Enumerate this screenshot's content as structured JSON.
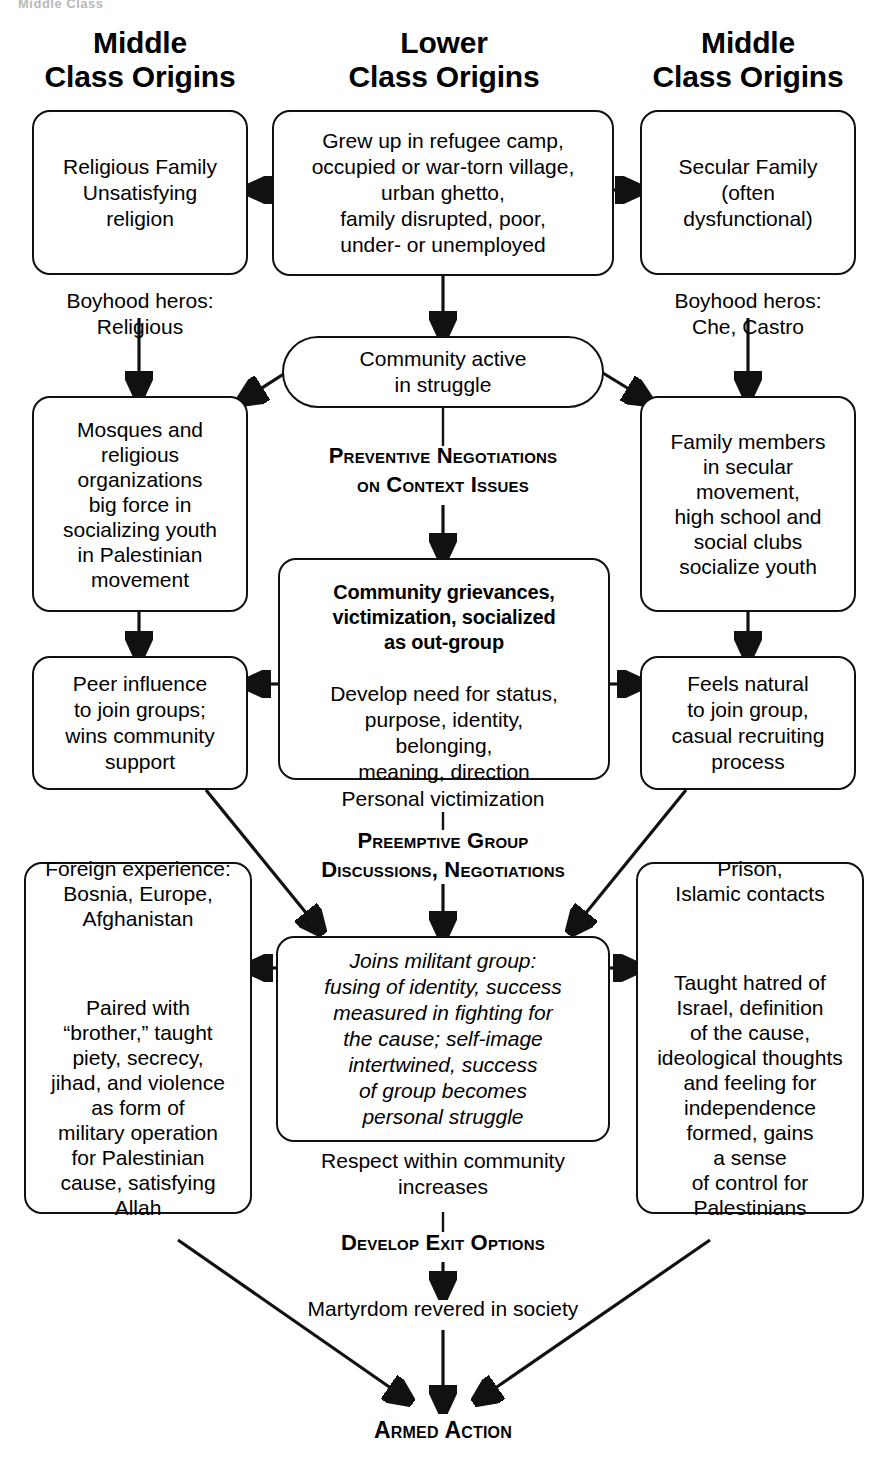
{
  "ghost_fragment": "Middle Class",
  "columns": {
    "left_heading": "Middle\nClass Origins",
    "center_heading": "Lower\nClass Origins",
    "right_heading": "Middle\nClass Origins"
  },
  "nodes": {
    "left_family": "Religious Family\nUnsatisfying\nreligion",
    "center_origin": "Grew up in refugee camp,\noccupied or war-torn village,\nurban ghetto,\nfamily disrupted, poor,\nunder- or unemployed",
    "right_family": "Secular Family\n(often\ndysfunctional)",
    "left_heros": "Boyhood heros:\nReligious",
    "right_heros": "Boyhood heros:\nChe, Castro",
    "center_community": "Community active\nin struggle",
    "left_mosques": "Mosques and\nreligious\norganizations\nbig force in\nsocializing youth\nin Palestinian\nmovement",
    "right_family_members": "Family members\nin secular\nmovement,\nhigh school and\nsocial clubs\nsocialize youth",
    "center_grievances_bold": "Community grievances,\nvictimization, socialized\nas out-group",
    "center_grievances_rest": "Develop need for status,\npurpose, identity,\nbelonging,\nmeaning, direction",
    "left_peer": "Peer influence\nto join groups;\nwins community\nsupport",
    "right_feels_natural": "Feels natural\nto join group,\ncasual recruiting\nprocess",
    "left_foreign": "Foreign experience:\nBosnia, Europe,\nAfghanistan",
    "left_foreign2": "Paired with\n“brother,” taught\npiety, secrecy,\njihad, and violence\nas form of\nmilitary operation\nfor Palestinian\ncause, satisfying\nAllah",
    "center_joins": "Joins militant group:\nfusing of identity, success\nmeasured in fighting for\nthe cause; self-image\nintertwined, success\nof group becomes\npersonal struggle",
    "right_prison": "Prison,\nIslamic contacts",
    "right_prison2": "Taught hatred of\nIsrael, definition\nof the cause,\nideological thoughts\nand feeling for\nindependence\nformed, gains\na sense\nof control for\nPalestinians"
  },
  "interventions": {
    "preventive": "Preventive Negotiations\non Context Issues",
    "preemptive": "Preemptive Group\nDiscussions, Negotiations",
    "develop_exit": "Develop Exit Options"
  },
  "connectors": {
    "personal_victimization": "Personal victimization",
    "respect_increases": "Respect within community\nincreases",
    "martyrdom": "Martyrdom revered in society"
  },
  "outcome": {
    "armed_action": "Armed Action"
  },
  "colors": {
    "ink": "#111111",
    "paper": "#ffffff",
    "ghost": "#b9b9b9"
  }
}
